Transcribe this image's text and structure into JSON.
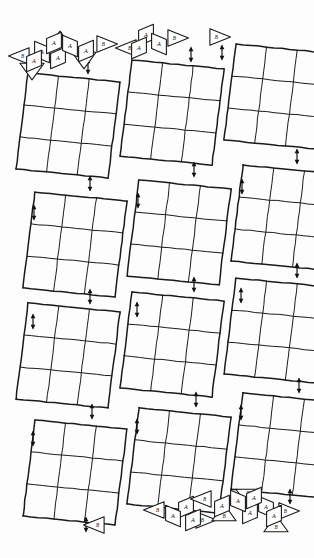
{
  "figure": {
    "background_color": "#fdfdfd",
    "ink_color": "#1a1a1a"
  },
  "labels": {
    "rhombus": "A",
    "triangle": "B"
  },
  "columns": [
    {
      "name": "left-column",
      "x": 6,
      "panel_count": 4,
      "panels": [
        {
          "name": "panel-L1",
          "x": 16,
          "y": 73,
          "w": 92,
          "h": 96
        },
        {
          "name": "panel-L2",
          "x": 23,
          "y": 192,
          "w": 92,
          "h": 96
        },
        {
          "name": "panel-L3",
          "x": 16,
          "y": 303,
          "w": 92,
          "h": 96
        },
        {
          "name": "panel-L4",
          "x": 23,
          "y": 420,
          "w": 92,
          "h": 96
        }
      ],
      "top_cluster": "cluster-large",
      "bottom_cluster": "cluster-single",
      "arrows": [
        {
          "name": "arrow-L-top",
          "x": 88,
          "y": 60
        },
        {
          "name": "arrow-L-1",
          "x": 90,
          "y": 177
        },
        {
          "name": "arrow-L-2",
          "x": 34,
          "y": 206
        },
        {
          "name": "arrow-L-3",
          "x": 90,
          "y": 290
        },
        {
          "name": "arrow-L-4",
          "x": 33,
          "y": 315
        },
        {
          "name": "arrow-L-5",
          "x": 92,
          "y": 405
        },
        {
          "name": "arrow-L-6",
          "x": 33,
          "y": 432
        },
        {
          "name": "arrow-L-bottom",
          "x": 86,
          "y": 518
        }
      ]
    },
    {
      "name": "middle-column",
      "x": 112,
      "panel_count": 4,
      "panels": [
        {
          "name": "panel-M1",
          "x": 120,
          "y": 60,
          "w": 92,
          "h": 96
        },
        {
          "name": "panel-M2",
          "x": 127,
          "y": 180,
          "w": 92,
          "h": 96
        },
        {
          "name": "panel-M3",
          "x": 120,
          "y": 292,
          "w": 92,
          "h": 96
        },
        {
          "name": "panel-M4",
          "x": 127,
          "y": 408,
          "w": 92,
          "h": 96
        }
      ],
      "top_cluster": "cluster-medium",
      "bottom_cluster": "cluster-medium",
      "arrows": [
        {
          "name": "arrow-M-top",
          "x": 191,
          "y": 48
        },
        {
          "name": "arrow-M-1",
          "x": 194,
          "y": 163
        },
        {
          "name": "arrow-M-2",
          "x": 138,
          "y": 194
        },
        {
          "name": "arrow-M-3",
          "x": 194,
          "y": 278
        },
        {
          "name": "arrow-M-4",
          "x": 137,
          "y": 303
        },
        {
          "name": "arrow-M-5",
          "x": 196,
          "y": 393
        },
        {
          "name": "arrow-M-6",
          "x": 137,
          "y": 420
        },
        {
          "name": "arrow-M-bottom",
          "x": 190,
          "y": 505
        }
      ]
    },
    {
      "name": "right-column",
      "x": 216,
      "panel_count": 4,
      "panels": [
        {
          "name": "panel-R1",
          "x": 224,
          "y": 44,
          "w": 92,
          "h": 96
        },
        {
          "name": "panel-R2",
          "x": 231,
          "y": 165,
          "w": 92,
          "h": 96
        },
        {
          "name": "panel-R3",
          "x": 224,
          "y": 278,
          "w": 92,
          "h": 96
        },
        {
          "name": "panel-R4",
          "x": 231,
          "y": 393,
          "w": 92,
          "h": 96
        }
      ],
      "top_cluster": "cluster-single",
      "bottom_cluster": "cluster-large",
      "arrows": [
        {
          "name": "arrow-R-top",
          "x": 222,
          "y": 46
        },
        {
          "name": "arrow-R-1",
          "x": 297,
          "y": 150
        },
        {
          "name": "arrow-R-2",
          "x": 242,
          "y": 180
        },
        {
          "name": "arrow-R-3",
          "x": 297,
          "y": 264
        },
        {
          "name": "arrow-R-4",
          "x": 241,
          "y": 289
        },
        {
          "name": "arrow-R-5",
          "x": 299,
          "y": 379
        },
        {
          "name": "arrow-R-6",
          "x": 241,
          "y": 406
        },
        {
          "name": "arrow-R-bottom",
          "x": 290,
          "y": 490
        }
      ]
    }
  ],
  "clusters": {
    "cluster-large": {
      "name": "tile-cluster-large",
      "tiles": [
        {
          "shape": "triangle",
          "label": "B"
        },
        {
          "shape": "triangle",
          "label": "B"
        },
        {
          "shape": "triangle",
          "label": "B"
        },
        {
          "shape": "triangle",
          "label": "B"
        },
        {
          "shape": "triangle",
          "label": "B"
        },
        {
          "shape": "rhombus",
          "label": "A"
        },
        {
          "shape": "rhombus",
          "label": "A"
        },
        {
          "shape": "rhombus",
          "label": "A"
        },
        {
          "shape": "rhombus",
          "label": "A"
        },
        {
          "shape": "rhombus",
          "label": "A"
        },
        {
          "shape": "rhombus",
          "label": "A"
        }
      ],
      "rhombus_count": 6,
      "triangle_count": 5
    },
    "cluster-medium": {
      "name": "tile-cluster-medium",
      "tiles": [
        {
          "shape": "triangle",
          "label": "B"
        },
        {
          "shape": "triangle",
          "label": "B"
        },
        {
          "shape": "rhombus",
          "label": "A"
        },
        {
          "shape": "rhombus",
          "label": "A"
        },
        {
          "shape": "rhombus",
          "label": "A"
        }
      ],
      "rhombus_count": 3,
      "triangle_count": 2
    },
    "cluster-single": {
      "name": "tile-cluster-single",
      "tiles": [
        {
          "shape": "triangle",
          "label": "B"
        }
      ],
      "rhombus_count": 0,
      "triangle_count": 1
    }
  },
  "grid": {
    "rows": 3,
    "cols": 3,
    "skew_note": "panels drawn as slanted parallelogram grids"
  }
}
